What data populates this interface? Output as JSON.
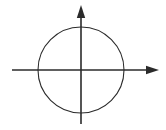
{
  "figure": {
    "background_color": "#ffffff",
    "stroke_color": "#2b2b2b",
    "width": 166,
    "height": 130
  },
  "chart_data": {
    "type": "scatter",
    "title": "",
    "subtitle": "",
    "xlabel": "",
    "ylabel": "",
    "grid": false,
    "legend": null,
    "axes": {
      "origin": {
        "x": 81,
        "y": 70
      },
      "x_axis": {
        "name": "x-axis",
        "orientation": "horizontal",
        "start": {
          "x": 12,
          "y": 70
        },
        "end": {
          "x": 159,
          "y": 70
        },
        "arrow_at_start": false,
        "arrow_at_end": true,
        "tick_labels": []
      },
      "y_axis": {
        "name": "y-axis",
        "orientation": "vertical",
        "start": {
          "x": 81,
          "y": 124
        },
        "end": {
          "x": 81,
          "y": 5
        },
        "arrow_at_start": false,
        "arrow_at_end": true,
        "tick_labels": []
      }
    },
    "shapes": [
      {
        "name": "circle",
        "type": "circle",
        "center_x": 81,
        "center_y": 70,
        "radius": 43,
        "fill": "none",
        "stroke": "#2b2b2b",
        "stroke_width": 1.1
      }
    ],
    "annotations": [],
    "series": []
  },
  "elements": {
    "circle_label": "circle",
    "x_axis_label": "x-axis",
    "y_axis_label": "y-axis",
    "x_arrowhead_label": "x-axis-arrowhead",
    "y_arrowhead_label": "y-axis-arrowhead"
  }
}
